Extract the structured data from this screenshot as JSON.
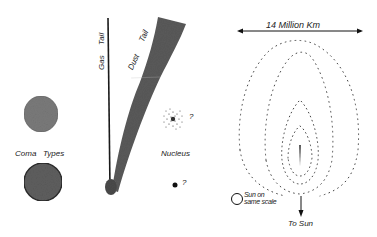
{
  "diagram": {
    "type": "comet-structure-illustration",
    "left_panel": {
      "gas_tail_label": "Gas",
      "gas_tail_label_2": "Tail",
      "dust_tail_label": "Dust",
      "dust_tail_label_2": "Tail",
      "coma_types_label_1": "Coma",
      "coma_types_label_2": "Types",
      "nucleus_label": "Nucleus",
      "nucleus_question_1": "?",
      "nucleus_question_2": "?"
    },
    "right_panel": {
      "scale_label": "14 Million   Km",
      "sun_scale_label_1": "Sun on",
      "sun_scale_label_2": "same scale",
      "to_sun_label": "To  Sun"
    },
    "colors": {
      "ink": "#222222",
      "coma_fill": "#6e6e6e",
      "dust_tail_fill": "#5a5a5a",
      "dot_color": "#444444"
    }
  }
}
